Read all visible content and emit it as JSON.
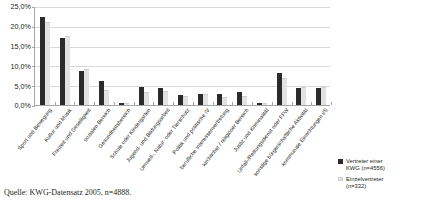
{
  "chart_data": {
    "type": "bar",
    "title": "",
    "xlabel": "",
    "ylabel": "",
    "ylim": [
      0,
      25
    ],
    "grid": true,
    "legend_position": "right-bottom",
    "ytick_labels": [
      "25,0%",
      "20,0%",
      "15,0%",
      "10,0%",
      "5,0%",
      "0,0%"
    ],
    "ytick_values": [
      25,
      20,
      15,
      10,
      5,
      0
    ],
    "categories": [
      "Sport und Bewegung",
      "Kultur und Musik",
      "Freizeit und Geselligkeit",
      "sozialen Bereich",
      "Gesundheitsbereich",
      "Schule oder Kindergarten",
      "Jugend- und Bildungsarbeit",
      "Umwelt-, Natur- oder Tierschutz",
      "Politik und politische IV",
      "berufliche Interessenvertretung",
      "kirchlicher / religiöser Bereich",
      "Justiz und Kriminalität",
      "Unfall-/Rettungsdienst oder FFW",
      "sonstige bürgerschaftliche Aktivität",
      "kommunale Einrichtungen i/S"
    ],
    "series": [
      {
        "name": "Vertreter einer KWG (n=4556)",
        "color": "#2b2b2b",
        "values": [
          22.1,
          17.0,
          8.5,
          6.1,
          0.4,
          4.6,
          4.2,
          2.6,
          2.7,
          2.7,
          3.3,
          0.4,
          8.0,
          4.3,
          4.4
        ]
      },
      {
        "name": "Einzelvertreter (n=332)",
        "color": "#e2e2e2",
        "values": [
          20.8,
          17.3,
          8.8,
          3.5,
          0.3,
          3.0,
          3.3,
          2.0,
          2.6,
          1.7,
          2.0,
          0.3,
          6.6,
          4.2,
          4.3
        ]
      }
    ]
  },
  "legend": {
    "entries": [
      {
        "label_line1": "Vertreter einer",
        "label_line2": "KWG (n=4556)"
      },
      {
        "label_line1": "Einzelvertreter",
        "label_line2": "(n=332)"
      }
    ]
  },
  "source": {
    "text": "Quelle: KWG-Datensatz 2005, n=4888."
  }
}
